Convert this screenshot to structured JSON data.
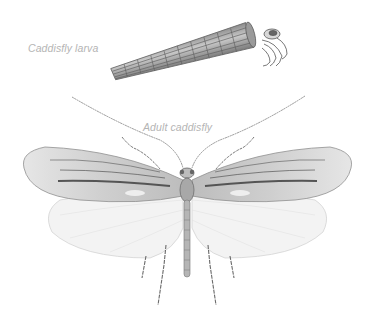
{
  "labels": {
    "larva": "Caddisfly larva",
    "adult": "Adult caddisfly"
  },
  "figures": [
    {
      "name": "caddisfly-larva-case",
      "description": "Larva in tubular case of stacked segments, head and legs protruding right"
    },
    {
      "name": "adult-caddisfly",
      "description": "Adult caddisfly, dorsal view, wings spread, long antennae"
    }
  ],
  "colors": {
    "label": "#b4b4b4",
    "ink": "#555555",
    "forewing": "#d9d9d9",
    "hindwing": "#f2f2f2"
  }
}
